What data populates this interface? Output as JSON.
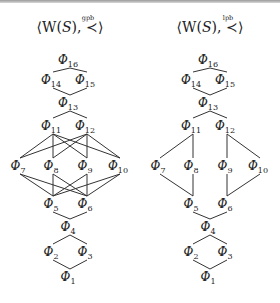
{
  "figure": {
    "diagrams": [
      {
        "id": "gpb",
        "title_prefix": "⟨W(",
        "title_S": "S",
        "title_mid": "), ",
        "relation_symbol": "≺",
        "relation_superscript": "gpb",
        "title_suffix": "⟩",
        "center_x": 70,
        "nodes": [
          {
            "id": "16",
            "label": "Φ",
            "sub": "16",
            "x": 70,
            "y": 62
          },
          {
            "id": "14",
            "label": "Φ",
            "sub": "14",
            "x": 53,
            "y": 82
          },
          {
            "id": "15",
            "label": "Φ",
            "sub": "15",
            "x": 87,
            "y": 82
          },
          {
            "id": "13",
            "label": "Φ",
            "sub": "13",
            "x": 70,
            "y": 105
          },
          {
            "id": "11",
            "label": "Φ",
            "sub": "11",
            "x": 53,
            "y": 128
          },
          {
            "id": "12",
            "label": "Φ",
            "sub": "12",
            "x": 87,
            "y": 128
          },
          {
            "id": "7",
            "label": "Φ",
            "sub": "7",
            "x": 20,
            "y": 168
          },
          {
            "id": "8",
            "label": "Φ",
            "sub": "8",
            "x": 53,
            "y": 168
          },
          {
            "id": "9",
            "label": "Φ",
            "sub": "9",
            "x": 87,
            "y": 168
          },
          {
            "id": "10",
            "label": "Φ",
            "sub": "10",
            "x": 120,
            "y": 168
          },
          {
            "id": "5",
            "label": "Φ",
            "sub": "5",
            "x": 53,
            "y": 206
          },
          {
            "id": "6",
            "label": "Φ",
            "sub": "6",
            "x": 87,
            "y": 206
          },
          {
            "id": "4",
            "label": "Φ",
            "sub": "4",
            "x": 70,
            "y": 229
          },
          {
            "id": "2",
            "label": "Φ",
            "sub": "2",
            "x": 53,
            "y": 254
          },
          {
            "id": "3",
            "label": "Φ",
            "sub": "3",
            "x": 87,
            "y": 254
          },
          {
            "id": "1",
            "label": "Φ",
            "sub": "1",
            "x": 70,
            "y": 279
          }
        ],
        "edges": [
          [
            "16",
            "14"
          ],
          [
            "16",
            "15"
          ],
          [
            "14",
            "13"
          ],
          [
            "15",
            "13"
          ],
          [
            "13",
            "11"
          ],
          [
            "13",
            "12"
          ],
          [
            "11",
            "7"
          ],
          [
            "11",
            "8"
          ],
          [
            "11",
            "9"
          ],
          [
            "11",
            "10"
          ],
          [
            "12",
            "7"
          ],
          [
            "12",
            "8"
          ],
          [
            "12",
            "9"
          ],
          [
            "12",
            "10"
          ],
          [
            "7",
            "5"
          ],
          [
            "8",
            "5"
          ],
          [
            "9",
            "5"
          ],
          [
            "10",
            "5"
          ],
          [
            "7",
            "6"
          ],
          [
            "8",
            "6"
          ],
          [
            "9",
            "6"
          ],
          [
            "10",
            "6"
          ],
          [
            "5",
            "4"
          ],
          [
            "6",
            "4"
          ],
          [
            "4",
            "2"
          ],
          [
            "4",
            "3"
          ],
          [
            "2",
            "1"
          ],
          [
            "3",
            "1"
          ]
        ]
      },
      {
        "id": "lpb",
        "title_prefix": "⟨W(",
        "title_S": "S",
        "title_mid": "), ",
        "relation_symbol": "≺",
        "relation_superscript": "lpb",
        "title_suffix": "⟩",
        "center_x": 210,
        "nodes": [
          {
            "id": "16",
            "label": "Φ",
            "sub": "16",
            "x": 210,
            "y": 62
          },
          {
            "id": "14",
            "label": "Φ",
            "sub": "14",
            "x": 193,
            "y": 82
          },
          {
            "id": "15",
            "label": "Φ",
            "sub": "15",
            "x": 227,
            "y": 82
          },
          {
            "id": "13",
            "label": "Φ",
            "sub": "13",
            "x": 210,
            "y": 105
          },
          {
            "id": "11",
            "label": "Φ",
            "sub": "11",
            "x": 193,
            "y": 128
          },
          {
            "id": "12",
            "label": "Φ",
            "sub": "12",
            "x": 227,
            "y": 128
          },
          {
            "id": "7",
            "label": "Φ",
            "sub": "7",
            "x": 160,
            "y": 168
          },
          {
            "id": "8",
            "label": "Φ",
            "sub": "8",
            "x": 193,
            "y": 168
          },
          {
            "id": "9",
            "label": "Φ",
            "sub": "9",
            "x": 227,
            "y": 168
          },
          {
            "id": "10",
            "label": "Φ",
            "sub": "10",
            "x": 260,
            "y": 168
          },
          {
            "id": "5",
            "label": "Φ",
            "sub": "5",
            "x": 193,
            "y": 206
          },
          {
            "id": "6",
            "label": "Φ",
            "sub": "6",
            "x": 227,
            "y": 206
          },
          {
            "id": "4",
            "label": "Φ",
            "sub": "4",
            "x": 210,
            "y": 229
          },
          {
            "id": "2",
            "label": "Φ",
            "sub": "2",
            "x": 193,
            "y": 254
          },
          {
            "id": "3",
            "label": "Φ",
            "sub": "3",
            "x": 227,
            "y": 254
          },
          {
            "id": "1",
            "label": "Φ",
            "sub": "1",
            "x": 210,
            "y": 279
          }
        ],
        "edges": [
          [
            "16",
            "14"
          ],
          [
            "16",
            "15"
          ],
          [
            "14",
            "13"
          ],
          [
            "15",
            "13"
          ],
          [
            "13",
            "11"
          ],
          [
            "13",
            "12"
          ],
          [
            "11",
            "7"
          ],
          [
            "11",
            "8"
          ],
          [
            "12",
            "9"
          ],
          [
            "12",
            "10"
          ],
          [
            "7",
            "5"
          ],
          [
            "8",
            "5"
          ],
          [
            "9",
            "6"
          ],
          [
            "10",
            "6"
          ],
          [
            "5",
            "4"
          ],
          [
            "6",
            "4"
          ],
          [
            "4",
            "2"
          ],
          [
            "4",
            "3"
          ],
          [
            "2",
            "1"
          ],
          [
            "3",
            "1"
          ]
        ]
      }
    ]
  }
}
